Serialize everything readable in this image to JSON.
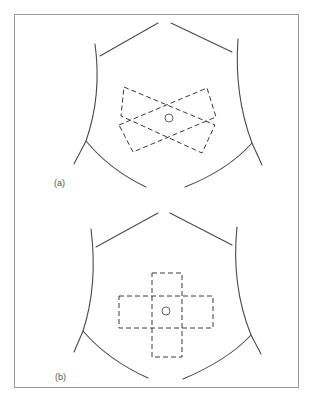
{
  "figure": {
    "panels": [
      {
        "label": "(a)",
        "arrangement": "crossed-diagonal",
        "description": "Two rectangular dashed pads crossed diagonally over the navel",
        "pads": [
          {
            "points": "124,87 215,125 202,153 121,116"
          },
          {
            "points": "119,125 207,88 216,117 133,152"
          }
        ],
        "navel": {
          "cx": 169,
          "cy": 118,
          "r": 4
        }
      },
      {
        "label": "(b)",
        "arrangement": "cross",
        "description": "Two rectangular dashed pads arranged as a cross over the navel",
        "pads": [
          {
            "x": 152,
            "y": 273,
            "w": 30,
            "h": 84
          },
          {
            "x": 119,
            "y": 296,
            "w": 94,
            "h": 32
          }
        ],
        "navel": {
          "cx": 166,
          "cy": 311,
          "r": 4
        }
      }
    ],
    "colors": {
      "frame": "#9a9a9a",
      "outline": "#4a4a4a",
      "pad": "#3a3a3a",
      "label": "#555555"
    }
  }
}
